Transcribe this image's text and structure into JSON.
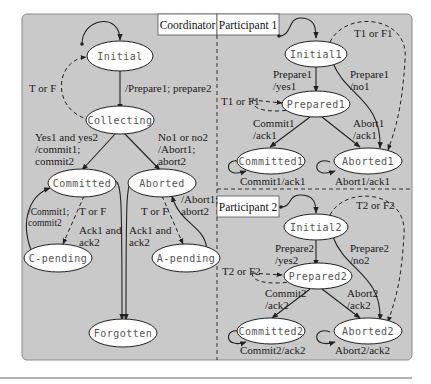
{
  "panels": {
    "coordinator": {
      "title": "Coordinator",
      "states": {
        "initial": "Initial",
        "collecting": "Collecting",
        "committed": "Committed",
        "aborted": "Aborted",
        "c_pending": "C-pending",
        "a_pending": "A-pending",
        "forgotten": "Forgotten"
      },
      "labels": {
        "t_or_f_top": "T or F",
        "prepare": "/Prepare1; prepare2",
        "yes_line1": "Yes1 and yes2",
        "yes_line2": "/commit1;",
        "yes_line3": "commit2",
        "no_line1": "No1 or no2",
        "no_line2": "/Abort1;",
        "no_line3": "abort2",
        "c_tf": "T or F",
        "c_resend1": "/Commit1;",
        "c_resend2": "commit2",
        "c_ack1": "Ack1 and",
        "c_ack2": "ack2",
        "a_ack1": "Ack1 and",
        "a_ack2": "ack2",
        "a_tf": "T or F",
        "a_resend1": "/Abort1;",
        "a_resend2": "abort2"
      }
    },
    "participant1": {
      "title": "Participant 1",
      "states": {
        "initial": "Initial1",
        "prepared": "Prepared1",
        "committed": "Committed1",
        "aborted": "Aborted1"
      },
      "labels": {
        "tf_top": "T1 or F1",
        "prep_yes1": "Prepare1",
        "prep_yes2": "/yes1",
        "prep_no1": "Prepare1",
        "prep_no2": "/no1",
        "tf_left": "T1 or F1",
        "commit1": "Commit1",
        "commit2": "/ack1",
        "abort1": "Abort1",
        "abort2": "/ack1",
        "commit_self": "Commit1/ack1",
        "abort_self": "Abort1/ack1"
      }
    },
    "participant2": {
      "title": "Participant 2",
      "states": {
        "initial": "Initial2",
        "prepared": "Prepared2",
        "committed": "Committed2",
        "aborted": "Aborted2"
      },
      "labels": {
        "tf_top": "T2 or F2",
        "prep_yes1": "Prepare2",
        "prep_yes2": "/yes2",
        "prep_no1": "Prepare2",
        "prep_no2": "/no2",
        "tf_left": "T2 or F2",
        "commit1": "Commit2",
        "commit2": "/ack2",
        "abort1": "Abort2",
        "abort2": "/ack2",
        "commit_self": "Commit2/ack2",
        "abort_self": "Abort2/ack2"
      }
    }
  },
  "colors": {
    "panel_bg": "#c9c9c9",
    "state_fill": "#ffffff",
    "stroke": "#222222"
  }
}
